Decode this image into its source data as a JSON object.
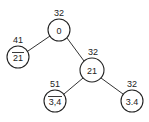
{
  "diagram": {
    "type": "tree",
    "colors": {
      "stroke": "#222222",
      "background": "#ffffff"
    },
    "nodes": [
      {
        "id": "root",
        "text": "0",
        "overbar": false,
        "label": "32",
        "cx": 59,
        "cy": 30,
        "r": 11
      },
      {
        "id": "left",
        "text": "21",
        "overbar": true,
        "label": "41",
        "cx": 18,
        "cy": 57,
        "r": 11
      },
      {
        "id": "right",
        "text": "21",
        "overbar": false,
        "label": "32",
        "cx": 92,
        "cy": 70,
        "r": 12
      },
      {
        "id": "right-left",
        "text": "3,4",
        "overbar": true,
        "label": "51",
        "cx": 55,
        "cy": 101,
        "r": 11
      },
      {
        "id": "right-right",
        "text": "3.4",
        "overbar": false,
        "label": "32",
        "cx": 132,
        "cy": 101,
        "r": 11
      }
    ],
    "edges": [
      {
        "from": "root",
        "to": "left"
      },
      {
        "from": "root",
        "to": "right"
      },
      {
        "from": "right",
        "to": "right-left"
      },
      {
        "from": "right",
        "to": "right-right"
      }
    ]
  }
}
